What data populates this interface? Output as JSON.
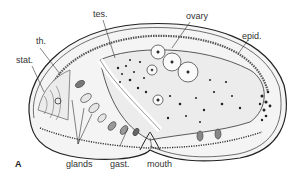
{
  "figure": {
    "panel_letter": "A",
    "colors": {
      "ink": "#222222",
      "body_fill": "#f2f2f2",
      "background": "#ffffff",
      "label": "#333333"
    }
  },
  "labels": {
    "tes": "tes.",
    "ovary": "ovary",
    "epid": "epid.",
    "th": "th.",
    "stat": "stat.",
    "glands": "glands",
    "gast": "gast.",
    "mouth": "mouth"
  }
}
